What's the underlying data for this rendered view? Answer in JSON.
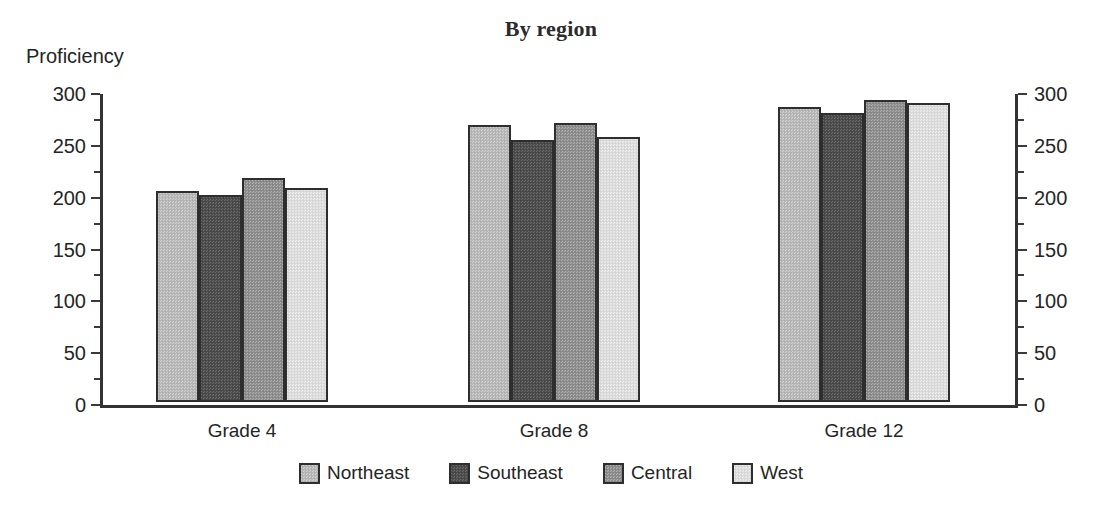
{
  "chart_data": {
    "type": "bar",
    "title": "By region",
    "xlabel": "",
    "ylabel": "Proficiency",
    "categories": [
      "Grade 4",
      "Grade 8",
      "Grade 12"
    ],
    "series": [
      {
        "name": "Northeast",
        "values": [
          204,
          267,
          285
        ],
        "color": "#b9b9b9"
      },
      {
        "name": "Southeast",
        "values": [
          200,
          253,
          279
        ],
        "color": "#4e4e4e"
      },
      {
        "name": "Central",
        "values": [
          216,
          269,
          291
        ],
        "color": "#919191"
      },
      {
        "name": "West",
        "values": [
          206,
          256,
          288
        ],
        "color": "#dedede"
      }
    ],
    "ylim": [
      0,
      300
    ],
    "yticks": [
      0,
      50,
      100,
      150,
      200,
      250,
      300
    ],
    "ytick_labels": [
      "0",
      "50",
      "100",
      "150",
      "200",
      "250",
      "300"
    ],
    "yminor_step": 25,
    "dual_y_axis": true,
    "right_axis_labels": [
      "0",
      "50",
      "100",
      "150",
      "200",
      "250",
      "300"
    ],
    "grid": false,
    "legend_position": "bottom",
    "bar_gap_within_group": 0,
    "outline_color": "#2e2e2e"
  },
  "figure": {
    "background": "#ffffff",
    "text_color": "#252525"
  }
}
